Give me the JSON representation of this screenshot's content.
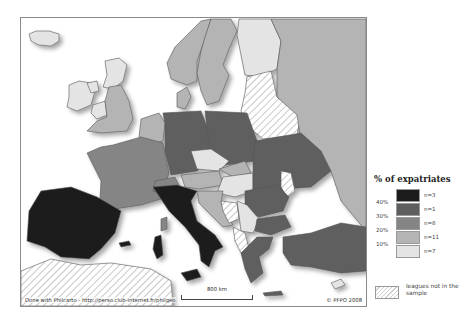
{
  "map": {
    "credit": "Done with Philcarto - http://perso.club-internet.fr/philgeo",
    "copyright": "© PFPO 2008",
    "scale_label": "800 km"
  },
  "legend": {
    "title": "% of expatriates",
    "ticks": [
      "40%",
      "30%",
      "20%",
      "10%"
    ],
    "classes": [
      {
        "n": "n=3",
        "color": "#1c1c1c"
      },
      {
        "n": "n=1",
        "color": "#5e5e5e"
      },
      {
        "n": "n=8",
        "color": "#858585"
      },
      {
        "n": "n=11",
        "color": "#b4b4b4"
      },
      {
        "n": "n=7",
        "color": "#e4e4e4"
      }
    ],
    "not_in_sample": "leagues not in the sample"
  },
  "colors": {
    "c40": "#1c1c1c",
    "c30": "#5e5e5e",
    "c20": "#858585",
    "c10": "#b4b4b4",
    "c0": "#e4e4e4",
    "border": "#555555"
  }
}
